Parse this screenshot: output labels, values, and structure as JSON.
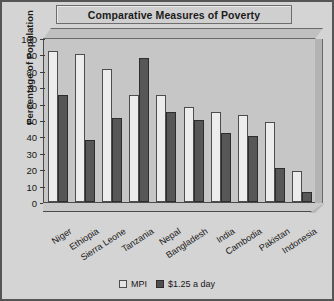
{
  "chart_data": {
    "type": "bar",
    "title": "Comparative Measures of Poverty",
    "xlabel": "",
    "ylabel": "Percentage of Population",
    "ylim": [
      0,
      100
    ],
    "ytick_step": 10,
    "yticks": [
      0,
      10,
      20,
      30,
      40,
      50,
      60,
      70,
      80,
      90,
      100
    ],
    "grid": false,
    "legend_position": "bottom",
    "categories": [
      "Niger",
      "Ethiopia",
      "Sierra Leone",
      "Tanzania",
      "Nepal",
      "Bangladesh",
      "India",
      "Cambodia",
      "Pakistan",
      "Indonesia"
    ],
    "series": [
      {
        "name": "MPI",
        "color": "#ececec",
        "values": [
          92,
          90,
          81,
          65,
          65,
          58,
          55,
          53,
          49,
          19
        ]
      },
      {
        "name": "$1.25 a day",
        "color": "#575757",
        "values": [
          65,
          38,
          51,
          88,
          55,
          50,
          42,
          40,
          21,
          6
        ]
      }
    ]
  },
  "legend": {
    "items": [
      {
        "label": "MPI",
        "swatch": "legend-swatch-light"
      },
      {
        "label": "$1.25 a day",
        "swatch": "legend-swatch-dark"
      }
    ]
  }
}
